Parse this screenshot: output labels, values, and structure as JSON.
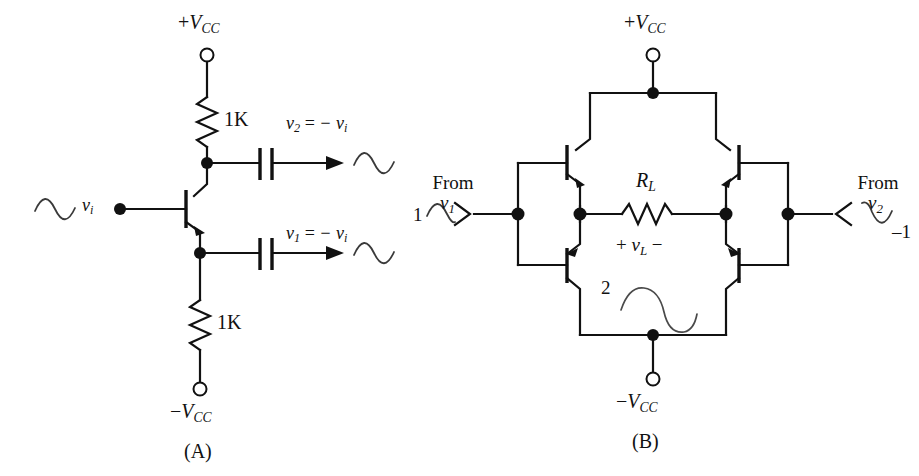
{
  "figure": {
    "type": "electronic-schematic",
    "background_color": "#ffffff",
    "line_color": "#111111"
  },
  "panel_a": {
    "caption": "(A)",
    "supply_top": {
      "sign": "+",
      "symbol": "V",
      "subscript": "CC",
      "text": "+VCC"
    },
    "supply_bottom": {
      "sign": "−",
      "symbol": "V",
      "subscript": "CC",
      "text": "−VCC"
    },
    "resistor_top": {
      "label": "1K",
      "value": "1K"
    },
    "resistor_bottom": {
      "label": "1K",
      "value": "1K"
    },
    "input": {
      "symbol": "v",
      "subscript": "i",
      "text": "vi",
      "waveform": "sine-positive-first",
      "icon": "sine-wave-icon"
    },
    "output_top": {
      "symbol": "v",
      "subscript": "2",
      "equals": "=",
      "expr": "− v",
      "expr_sub": "i",
      "text": "v2 = − vi",
      "waveform": "sine-positive-first",
      "icon": "sine-wave-icon"
    },
    "output_bottom": {
      "symbol": "v",
      "subscript": "1",
      "equals": "=",
      "expr": "− v",
      "expr_sub": "i",
      "text": "v1 = − vi",
      "waveform": "sine-positive-first",
      "icon": "sine-wave-icon"
    },
    "devices": {
      "transistor": "npn-transistor-icon",
      "capacitor_top": "capacitor-icon",
      "capacitor_bottom": "capacitor-icon",
      "terminal_top": "open-terminal-icon",
      "terminal_bottom": "open-terminal-icon"
    }
  },
  "panel_b": {
    "caption": "(B)",
    "supply_top": {
      "sign": "+",
      "symbol": "V",
      "subscript": "CC",
      "text": "+VCC"
    },
    "supply_bottom": {
      "sign": "−",
      "symbol": "V",
      "subscript": "CC",
      "text": "−VCC"
    },
    "load_resistor": {
      "symbol": "R",
      "subscript": "L",
      "text": "RL"
    },
    "load_voltage": {
      "plus": "+",
      "symbol": "v",
      "subscript": "L",
      "minus": "−",
      "text": "+ vL −"
    },
    "source_left": {
      "from_text": "From",
      "symbol": "v",
      "subscript": "1",
      "text": "From v1",
      "amplitude_label": "1",
      "waveform": "sine-positive-first",
      "icon": "sine-wave-icon",
      "connector": "arrow-right-connector-icon"
    },
    "source_right": {
      "from_text": "From",
      "symbol": "v",
      "subscript": "2",
      "text": "From v2",
      "amplitude_label": "–1",
      "waveform": "sine-negative-first",
      "icon": "sine-wave-inverted-icon",
      "connector": "arrow-left-connector-icon"
    },
    "load_waveform": {
      "amplitude_label": "2",
      "waveform": "sine-positive-first-large",
      "icon": "sine-wave-large-icon"
    },
    "devices": {
      "transistor_top_left": "npn-transistor-icon",
      "transistor_top_right": "npn-transistor-icon",
      "transistor_bottom_left": "pnp-transistor-icon",
      "transistor_bottom_right": "pnp-transistor-icon",
      "terminal_top": "open-terminal-icon",
      "terminal_bottom": "open-terminal-icon"
    }
  }
}
